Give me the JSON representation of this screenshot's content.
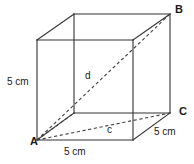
{
  "figure": {
    "stroke_color": "#333333",
    "dash_color": "#4a4a4a",
    "background": "#ffffff",
    "width": 194,
    "height": 164
  },
  "vertices": [
    {
      "id": "A",
      "label": "A",
      "x": 30,
      "y": 136,
      "role": "front-bottom-left"
    },
    {
      "id": "B",
      "label": "B",
      "x": 175,
      "y": 4,
      "role": "back-top-right"
    },
    {
      "id": "C",
      "label": "C",
      "x": 179,
      "y": 106,
      "role": "back-bottom-right"
    }
  ],
  "dimensions": [
    {
      "id": "left-edge",
      "label": "5 cm",
      "x": 7,
      "y": 77,
      "edge": "vertical-left"
    },
    {
      "id": "bottom-edge",
      "label": "5 cm",
      "x": 64,
      "y": 147,
      "edge": "front-bottom"
    },
    {
      "id": "right-edge",
      "label": "5 cm",
      "x": 154,
      "y": 127,
      "edge": "bottom-right-depth"
    }
  ],
  "diagonals": [
    {
      "id": "d",
      "label": "d",
      "x": 85,
      "y": 71,
      "from": "A",
      "to": "B",
      "style": "dashed",
      "kind": "space-diagonal"
    },
    {
      "id": "c",
      "label": "c",
      "x": 107,
      "y": 125,
      "from": "A",
      "to": "C",
      "style": "dashed",
      "kind": "face-diagonal"
    }
  ]
}
